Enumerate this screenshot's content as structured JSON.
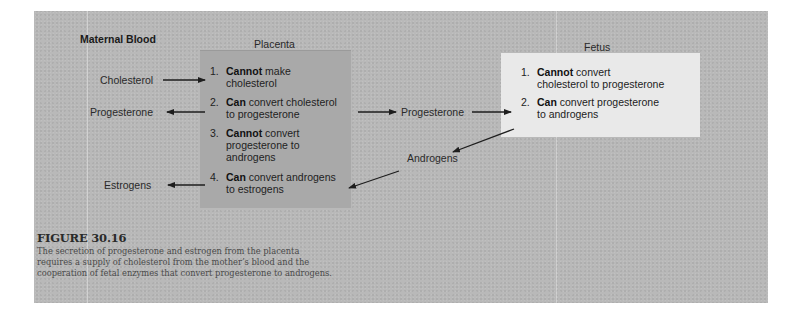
{
  "diagram": {
    "regions": {
      "maternal_blood": "Maternal Blood",
      "placenta": "Placenta",
      "fetus": "Fetus"
    },
    "maternal_labels": {
      "cholesterol": "Cholesterol",
      "progesterone": "Progesterone",
      "estrogens": "Estrogens"
    },
    "middle_labels": {
      "progesterone": "Progesterone",
      "androgens": "Androgens"
    },
    "placenta_items": [
      {
        "num": "1.",
        "bold": "Cannot",
        "line1": " make",
        "line2": "cholesterol",
        "line3": ""
      },
      {
        "num": "2.",
        "bold": "Can",
        "line1": " convert cholesterol",
        "line2": "to progesterone",
        "line3": ""
      },
      {
        "num": "3.",
        "bold": "Cannot",
        "line1": " convert",
        "line2": "progesterone to",
        "line3": "androgens"
      },
      {
        "num": "4.",
        "bold": "Can",
        "line1": " convert androgens",
        "line2": "to estrogens",
        "line3": ""
      }
    ],
    "fetus_items": [
      {
        "num": "1.",
        "bold": "Cannot",
        "line1": " convert",
        "line2": "cholesterol to progesterone"
      },
      {
        "num": "2.",
        "bold": "Can",
        "line1": " convert progesterone",
        "line2": "to androgens"
      }
    ],
    "flows": [
      {
        "from": "Maternal Cholesterol",
        "to": "Placenta item 1"
      },
      {
        "from": "Placenta item 2",
        "to": "Maternal Progesterone"
      },
      {
        "from": "Placenta item 2",
        "to": "Progesterone (middle)"
      },
      {
        "from": "Progesterone (middle)",
        "to": "Fetus item 2"
      },
      {
        "from": "Fetus item 2",
        "to": "Androgens (middle)"
      },
      {
        "from": "Androgens (middle)",
        "to": "Placenta item 4"
      },
      {
        "from": "Placenta item 4",
        "to": "Maternal Estrogens"
      }
    ],
    "colors": {
      "panel_bg": "#b9b9b9",
      "placenta_box": "#a9a9a9",
      "fetus_box": "#e9e9e9",
      "arrow": "#1e1e1e"
    }
  },
  "caption": {
    "title": "FIGURE 30.16",
    "text": "The secretion of progesterone and estrogen from the placenta requires a supply of cholesterol from the mother’s blood and the cooperation of fetal enzymes that convert progesterone to androgens."
  }
}
